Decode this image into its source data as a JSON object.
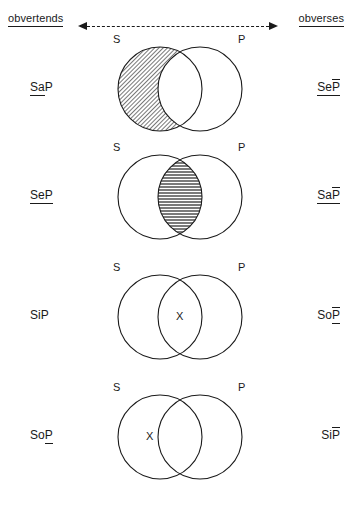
{
  "header": {
    "left_label": "obvertends",
    "right_label": "obverses",
    "arrow_left_icon": "arrow-left-icon",
    "arrow_right_icon": "arrow-right-icon",
    "connector": "dashed-double-arrow"
  },
  "circle_labels": {
    "subject": "S",
    "predicate": "P"
  },
  "marks": {
    "x": "X"
  },
  "colors": {
    "stroke": "#1a1a1a",
    "shade_fill": "#b3b3b3",
    "background": "#ffffff"
  },
  "rows": [
    {
      "obvertend": {
        "prefix": "Sa",
        "predicate": "P",
        "underline": "prefix",
        "overline": false,
        "full": "SaP"
      },
      "obverse": {
        "prefix": "Se",
        "predicate": "P",
        "underline": "all",
        "overline": true,
        "full": "SeP̄"
      },
      "shaded_region": "s-only",
      "x_region": "none"
    },
    {
      "obvertend": {
        "prefix": "Se",
        "predicate": "P",
        "underline": "all",
        "overline": false,
        "full": "SeP"
      },
      "obverse": {
        "prefix": "Sa",
        "predicate": "P",
        "underline": "all",
        "overline": true,
        "full": "SaP̄"
      },
      "shaded_region": "intersection",
      "x_region": "none"
    },
    {
      "obvertend": {
        "prefix": "Si",
        "predicate": "P",
        "underline": "none",
        "overline": false,
        "full": "SiP"
      },
      "obverse": {
        "prefix": "So",
        "predicate": "P",
        "underline": "predicate",
        "overline": true,
        "full": "SoP̄"
      },
      "shaded_region": "none",
      "x_region": "intersection"
    },
    {
      "obvertend": {
        "prefix": "So",
        "predicate": "P",
        "underline": "predicate",
        "overline": false,
        "full": "SoP"
      },
      "obverse": {
        "prefix": "Si",
        "predicate": "P",
        "underline": "none",
        "overline": true,
        "full": "SiP̄"
      },
      "shaded_region": "none",
      "x_region": "s-only"
    }
  ]
}
